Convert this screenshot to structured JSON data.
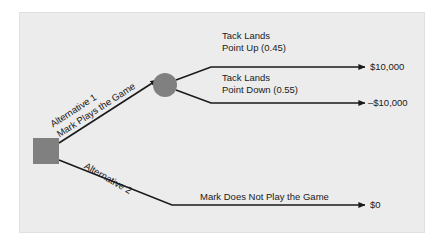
{
  "figure": {
    "type": "decision-tree",
    "background_color": "#ececec",
    "node_fill_color": "#808080",
    "line_color": "#1a1a1a"
  },
  "nodes": {
    "decision": {
      "shape": "square",
      "name": "decision-node"
    },
    "chance": {
      "shape": "circle",
      "name": "chance-node"
    }
  },
  "branches": {
    "alternative_1": {
      "line1": "Alternative 1",
      "line2": "Mark Plays the Game"
    },
    "alternative_2": {
      "line1": "Alternative 2",
      "outcome_label": "Mark Does Not Play the Game"
    }
  },
  "outcomes": [
    {
      "line1": "Tack Lands",
      "line2": "Point Up (0.45)",
      "probability": "0.45",
      "payoff": "$10,000"
    },
    {
      "line1": "Tack Lands",
      "line2": "Point Down (0.55)",
      "probability": "0.55",
      "payoff": "–$10,000"
    }
  ],
  "alternative_2_payoff": "$0"
}
